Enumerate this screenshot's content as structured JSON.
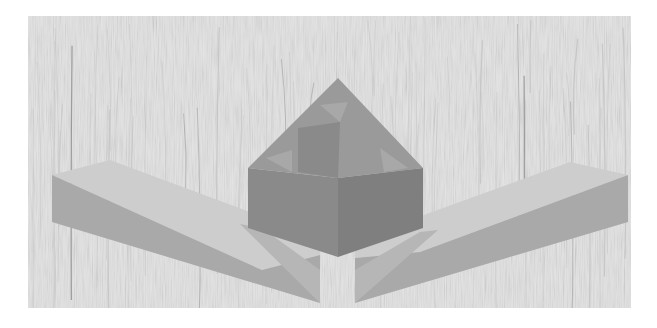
{
  "scene": {
    "description": "3D render of a woodworking corner joint: a separate corner key block floating above two mitered beams, on a light wood-grain background",
    "objects": [
      {
        "id": "corner-block",
        "label": "Corner key block"
      },
      {
        "id": "left-beam",
        "label": "Left mitered beam"
      },
      {
        "id": "right-beam",
        "label": "Right mitered beam"
      }
    ]
  },
  "colors": {
    "page_bg": "#ffffff",
    "wood_bg": "#e3e3e3",
    "grain": "#b9b9b9",
    "grain_dark": "#6f6f6f",
    "block_top": "#9a9a9a",
    "block_left": "#8a8a8a",
    "block_right": "#7f7f7f",
    "block_notch": "#a8a8a8",
    "beam_top": "#cdcdcd",
    "beam_front": "#a9a9a9",
    "beam_front_dark": "#9c9c9c",
    "miter_face": "#b6b6b6"
  }
}
